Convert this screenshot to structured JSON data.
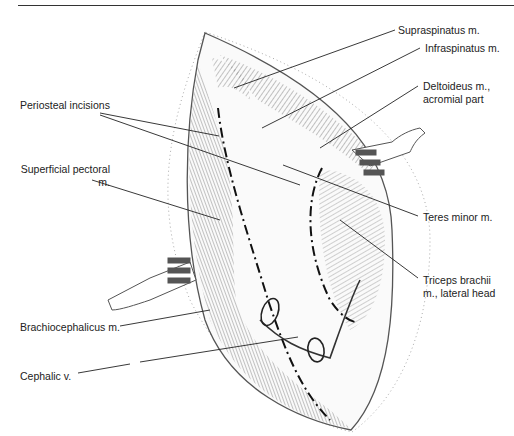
{
  "figure": {
    "type": "surgical-anatomy-illustration"
  },
  "labels": [
    {
      "id": "supraspinatus",
      "text": "Supraspinatus m.",
      "x": 398,
      "y": 24
    },
    {
      "id": "infraspinatus",
      "text": "Infraspinatus m.",
      "x": 425,
      "y": 42
    },
    {
      "id": "deltoideus",
      "line1": "Deltoideus m.,",
      "line2": "acromial part",
      "x": 423,
      "y": 80
    },
    {
      "id": "periosteal",
      "text": "Periosteal incisions",
      "x": 20,
      "y": 99
    },
    {
      "id": "superficial-pectoral",
      "line1": "Superficial pectoral",
      "line2": "m.",
      "x": 20,
      "y": 163
    },
    {
      "id": "teres-minor",
      "text": "Teres minor m.",
      "x": 423,
      "y": 211
    },
    {
      "id": "triceps",
      "line1": "Triceps brachii",
      "line2": "m., lateral head",
      "x": 423,
      "y": 274
    },
    {
      "id": "brachiocephalicus",
      "text": "Brachiocephalicus m.",
      "x": 20,
      "y": 321
    },
    {
      "id": "cephalic-vein",
      "text": "Cephalic v.",
      "x": 20,
      "y": 370
    }
  ],
  "colors": {
    "ink": "#222222",
    "muscle": "#6f6f6f",
    "background": "#ffffff"
  }
}
